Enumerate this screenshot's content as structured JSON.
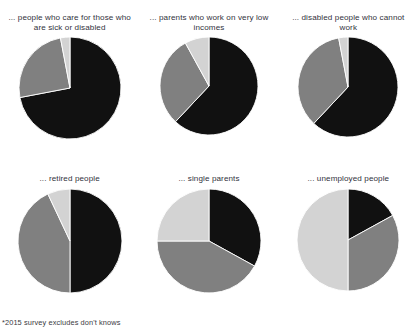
{
  "figure": {
    "background": "#ffffff",
    "footnote": "*2015 survey excludes don't knows"
  },
  "palette": {
    "black": "#111111",
    "medium_gray": "#808080",
    "light_gray": "#d3d3d3",
    "outline": "#ffffff"
  },
  "chart_data": [
    {
      "type": "pie",
      "title": "... people who care for those who are sick or disabled",
      "categories": [
        "black",
        "medium gray",
        "light gray"
      ],
      "values": [
        72,
        25,
        3
      ],
      "colors": [
        "#111111",
        "#808080",
        "#d3d3d3"
      ],
      "start_angle": 0,
      "direction": "clockwise",
      "legend": "none",
      "grid": false
    },
    {
      "type": "pie",
      "title": "... parents who work on very low incomes",
      "categories": [
        "black",
        "medium gray",
        "light gray"
      ],
      "values": [
        62,
        30,
        8
      ],
      "colors": [
        "#111111",
        "#808080",
        "#d3d3d3"
      ],
      "start_angle": 0,
      "direction": "clockwise",
      "legend": "none",
      "grid": false
    },
    {
      "type": "pie",
      "title": "... disabled people who cannot work",
      "categories": [
        "black",
        "medium gray",
        "light gray"
      ],
      "values": [
        62,
        35,
        3
      ],
      "colors": [
        "#111111",
        "#808080",
        "#d3d3d3"
      ],
      "start_angle": 0,
      "direction": "clockwise",
      "legend": "none",
      "grid": false
    },
    {
      "type": "pie",
      "title": "... retired people",
      "categories": [
        "black",
        "medium gray",
        "light gray"
      ],
      "values": [
        50,
        43,
        7
      ],
      "colors": [
        "#111111",
        "#808080",
        "#d3d3d3"
      ],
      "start_angle": 0,
      "direction": "clockwise",
      "legend": "none",
      "grid": false
    },
    {
      "type": "pie",
      "title": "... single parents",
      "categories": [
        "black",
        "medium gray",
        "light gray"
      ],
      "values": [
        33,
        42,
        25
      ],
      "colors": [
        "#111111",
        "#808080",
        "#d3d3d3"
      ],
      "start_angle": 0,
      "direction": "clockwise",
      "legend": "none",
      "grid": false
    },
    {
      "type": "pie",
      "title": "... unemployed people",
      "categories": [
        "black",
        "medium gray",
        "light gray"
      ],
      "values": [
        17,
        33,
        50
      ],
      "colors": [
        "#111111",
        "#808080",
        "#d3d3d3"
      ],
      "start_angle": 0,
      "direction": "clockwise",
      "legend": "none",
      "grid": false
    }
  ],
  "pie_geometry": [
    {
      "radius": 51,
      "box": 106
    },
    {
      "radius": 49,
      "box": 102
    },
    {
      "radius": 50,
      "box": 104
    },
    {
      "radius": 52,
      "box": 108
    },
    {
      "radius": 52,
      "box": 108
    },
    {
      "radius": 51,
      "box": 106
    }
  ]
}
